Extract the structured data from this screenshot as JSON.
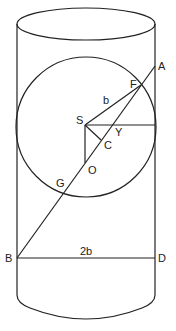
{
  "diagram": {
    "type": "geometry",
    "labels": {
      "A": "A",
      "F": "F",
      "b": "b",
      "S": "S",
      "Y": "Y",
      "C": "C",
      "O": "O",
      "G": "G",
      "B": "B",
      "D": "D",
      "twob": "2b"
    }
  }
}
